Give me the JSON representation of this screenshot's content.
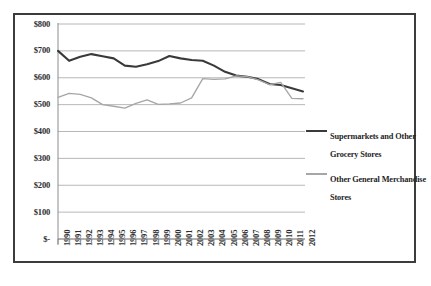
{
  "chart_data": {
    "type": "line",
    "title": "",
    "xlabel": "",
    "ylabel": "",
    "grid": true,
    "legend_position": "right",
    "ylim": [
      0,
      800
    ],
    "ytick_values": [
      0,
      100,
      200,
      300,
      400,
      500,
      600,
      700,
      800
    ],
    "ytick_labels": [
      "$-",
      "$100",
      "$200",
      "$300",
      "$400",
      "$500",
      "$600",
      "$700",
      "$800"
    ],
    "categories": [
      "1990",
      "1991",
      "1992",
      "1993",
      "1994",
      "1995",
      "1996",
      "1997",
      "1998",
      "1999",
      "2000",
      "2001",
      "2002",
      "2003",
      "2004",
      "2005",
      "2006",
      "2007",
      "2008",
      "2009",
      "2010",
      "2011",
      "2012"
    ],
    "series": [
      {
        "name": "Supermarkets and Other Grocery Stores",
        "color": "#3a3a3a",
        "values": [
          700,
          663,
          678,
          688,
          680,
          672,
          645,
          641,
          650,
          662,
          681,
          672,
          666,
          663,
          645,
          622,
          608,
          604,
          595,
          577,
          573,
          561,
          549
        ]
      },
      {
        "name": "Other General Merchandise Stores",
        "color": "#a6a6a6",
        "values": [
          527,
          542,
          538,
          525,
          500,
          494,
          487,
          505,
          518,
          501,
          503,
          506,
          525,
          597,
          594,
          596,
          607,
          604,
          592,
          574,
          583,
          523,
          522
        ]
      }
    ]
  },
  "legend": {
    "entries": [
      {
        "label": "Supermarkets and Other Grocery Stores",
        "swatch": "thick-dark-line-swatch"
      },
      {
        "label": "Other General Merchandise Stores",
        "swatch": "thin-gray-line-swatch"
      }
    ]
  },
  "colors": {
    "series_dark": "#3a3a3a",
    "series_gray": "#a6a6a6",
    "gridline": "#b0b0b0",
    "axis": "#808080",
    "border": "#3c3c3c",
    "text": "#2b2b2b",
    "background": "#ffffff"
  }
}
